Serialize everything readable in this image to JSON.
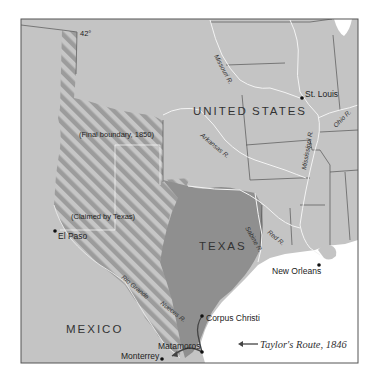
{
  "map": {
    "title_regions": {
      "united_states": [
        "UNITED",
        "STATES"
      ],
      "texas": "TEXAS",
      "mexico": "MEXICO"
    },
    "labels": {
      "latitude": "42°",
      "final_boundary": "(Final boundary, 1850)",
      "claimed_by_texas": "(Claimed by Texas)"
    },
    "cities": [
      {
        "name": "St. Louis"
      },
      {
        "name": "El Paso"
      },
      {
        "name": "New Orleans"
      },
      {
        "name": "Corpus Christi"
      },
      {
        "name": "Matamoros"
      },
      {
        "name": "Monterrey"
      }
    ],
    "rivers": [
      {
        "name": "Missouri R."
      },
      {
        "name": "Arkansas R."
      },
      {
        "name": "Ohio R."
      },
      {
        "name": "Mississippi R."
      },
      {
        "name": "Red R."
      },
      {
        "name": "Sabine R."
      },
      {
        "name": "Rio Grande"
      },
      {
        "name": "Nueces R."
      }
    ],
    "legend": {
      "route_label": "Taylor's Route, 1846"
    },
    "colors": {
      "land": "#c4c4c4",
      "texas": "#8f8f8f",
      "stripe_dark": "#9a9a9a",
      "stripe_light": "#c8c8c8",
      "water": "#ffffff",
      "frame": "#555555",
      "route": "#444444"
    }
  }
}
